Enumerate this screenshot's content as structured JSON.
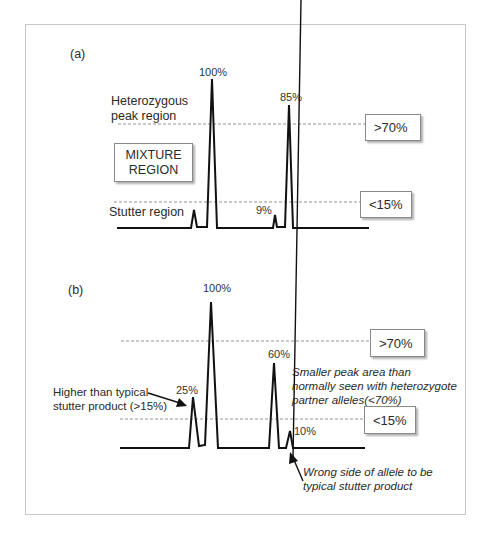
{
  "panel_a": {
    "label": "(a)",
    "peak_labels": {
      "p1": "100%",
      "p2": "85%",
      "s2": "9%"
    },
    "region_labels": {
      "heterozygous_line1": "Heterozygous",
      "heterozygous_line2": "peak region",
      "stutter": "Stutter region"
    },
    "mixture_box": {
      "line1": "MIXTURE",
      "line2": "REGION"
    },
    "threshold_boxes": {
      "high": ">70%",
      "low": "<15%"
    }
  },
  "panel_b": {
    "label": "(b)",
    "peak_labels": {
      "s1": "25%",
      "p1": "100%",
      "p2": "60%",
      "s2": "10%"
    },
    "threshold_boxes": {
      "high": ">70%",
      "low": "<15%"
    },
    "annotations": {
      "high_stutter_line1": "Higher than typical",
      "high_stutter_line2": "stutter product (>15%)",
      "small_peak": "Smaller peak area than normally seen with heterozygote partner alleles(<70%)",
      "wrong_side_line1": "Wrong side of allele to be",
      "wrong_side_line2": "typical stutter product"
    }
  },
  "colors": {
    "trace": "#111111",
    "dash": "#7a7a7a",
    "border": "#c8c8c8"
  }
}
